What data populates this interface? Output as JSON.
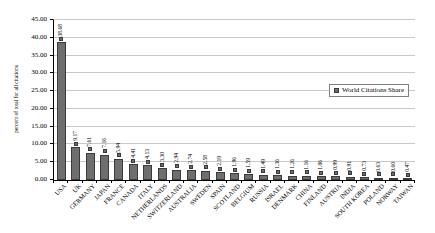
{
  "chart_data": {
    "type": "bar",
    "title": "",
    "xlabel": "",
    "ylabel": "percent of total for all citations",
    "ylim": [
      0,
      45
    ],
    "ytick_step": 5,
    "grid": true,
    "legend": {
      "label": "World Citations Share",
      "position": "right-inside"
    },
    "yticks": [
      "45.00",
      "40.00",
      "35.00",
      "30.00",
      "25.00",
      "20.00",
      "15.00",
      "10.00",
      "5.00",
      "0.00"
    ],
    "categories": [
      "USA",
      "UK",
      "GERMANY",
      "JAPAN",
      "FRANCE",
      "CANADA",
      "ITALY",
      "NETHERLANDS",
      "SWITZERLAND",
      "AUSTRALIA",
      "SWEDEN",
      "SPAIN",
      "SCOTLAND",
      "BELGIUM",
      "RUSSIA",
      "ISRAEL",
      "DENMARK",
      "CHINA",
      "FINLAND",
      "AUSTRIA",
      "INDIA",
      "SOUTH KOREA",
      "POLAND",
      "NORWAY",
      "TAIWAN"
    ],
    "values": [
      38.68,
      9.17,
      7.61,
      7.16,
      5.94,
      4.41,
      4.13,
      3.3,
      2.94,
      2.74,
      2.58,
      2.19,
      1.96,
      1.59,
      1.49,
      1.36,
      1.26,
      1.16,
      1.06,
      0.99,
      0.91,
      0.73,
      0.63,
      0.6,
      0.47
    ],
    "value_labels": [
      "38.68",
      "9.17",
      "7.61",
      "7.16",
      "5.94",
      "4.41",
      "4.13",
      "3.30",
      "2.94",
      "2.74",
      "2.58",
      "2.19",
      "1.96",
      "1.59",
      "1.49",
      "1.36",
      "1.26",
      "1.16",
      "1.06",
      "0.99",
      "0.91",
      "0.73",
      "0.63",
      "0.60",
      "0.47"
    ],
    "colors": {
      "bar": "#6e6e6e",
      "bar_border": "#3a3a3a",
      "gridline": "#c9c9c9",
      "axis": "#000000",
      "background": "#ffffff",
      "legend_border": "#808080"
    }
  }
}
